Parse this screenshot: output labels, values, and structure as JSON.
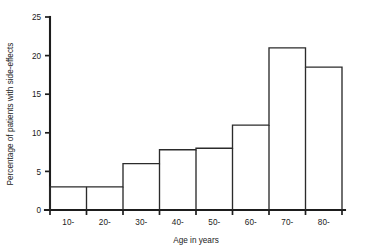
{
  "chart_data": {
    "type": "bar",
    "title": "",
    "xlabel": "Age in years",
    "ylabel": "Percentage of patients with side-effects",
    "categories": [
      "10-",
      "20-",
      "30-",
      "40-",
      "50-",
      "60-",
      "70-",
      "80-"
    ],
    "values": [
      3,
      3,
      6,
      7.8,
      8,
      11,
      21,
      18.5
    ],
    "ylim": [
      0,
      25
    ],
    "ytick_labels": [
      "0",
      "5",
      "10",
      "15",
      "20",
      "25"
    ],
    "ytick_values": [
      0,
      5,
      10,
      15,
      20,
      25
    ],
    "xlim_bins": [
      10,
      20,
      30,
      40,
      50,
      60,
      70,
      80,
      90
    ],
    "grid": false,
    "legend": "none",
    "bar_fill": "#ffffff",
    "bar_stroke": "#2b2b2b",
    "axis_color": "#1d1d1d"
  },
  "figure": {
    "background": "#ffffff"
  }
}
